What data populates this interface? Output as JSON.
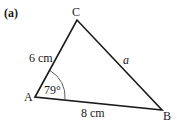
{
  "figure": {
    "part_label": "(a)",
    "vertices": {
      "A": "A",
      "B": "B",
      "C": "C"
    },
    "sides": {
      "AC": "6 cm",
      "AB": "8 cm",
      "CB": "a"
    },
    "angle_A": "79°",
    "colors": {
      "stroke": "#1a1a1a",
      "text": "#1a1a1a",
      "background": "#ffffff"
    }
  }
}
